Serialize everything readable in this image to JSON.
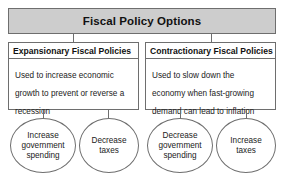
{
  "diagram": {
    "title": "Fiscal Policy Options",
    "columns": [
      {
        "header": "Expansionary Fiscal Policies",
        "body": "Used to increase economic growth to prevent or reverse a recession",
        "actions": [
          "Increase government spending",
          "Decrease taxes"
        ]
      },
      {
        "header": "Contractionary Fiscal Policies",
        "body": "Used to slow down the economy when fast-growing demand can lead to inflation",
        "actions": [
          "Decrease government spending",
          "Increase taxes"
        ]
      }
    ],
    "colors": {
      "title_fill": "#cdcdcd",
      "border": "#6e6e6e",
      "box_fill": "#ffffff",
      "text": "#1a1a1a",
      "background": "#ffffff"
    }
  }
}
